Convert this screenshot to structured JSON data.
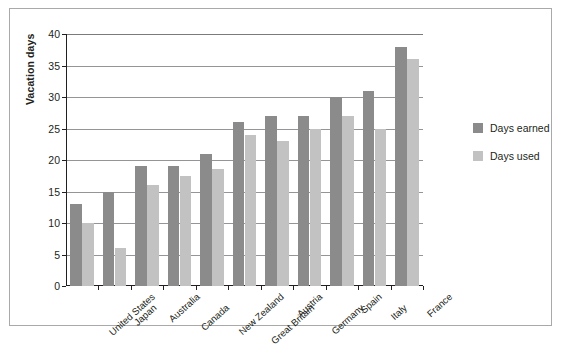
{
  "chart_data": {
    "type": "bar",
    "title": "",
    "xlabel": "",
    "ylabel": "Vacation days",
    "ylim": [
      0,
      40
    ],
    "yticks": [
      0,
      5,
      10,
      15,
      20,
      25,
      30,
      35,
      40
    ],
    "grid": true,
    "legend_position": "right",
    "categories": [
      "United States",
      "Japan",
      "Australia",
      "Canada",
      "New Zealand",
      "Great Britain",
      "Austria",
      "Germany",
      "Spain",
      "Italy",
      "France"
    ],
    "series": [
      {
        "name": "Days earned",
        "color": "#8b8b8b",
        "values": [
          13,
          15,
          19,
          19,
          21,
          26,
          27,
          27,
          30,
          31,
          38
        ]
      },
      {
        "name": "Days used",
        "color": "#c2c2c2",
        "values": [
          10,
          6,
          16,
          17.5,
          18.5,
          24,
          23,
          25,
          27,
          25,
          36
        ]
      }
    ]
  },
  "colors": {
    "earned": "#8b8b8b",
    "used": "#c2c2c2",
    "axis": "#231f20",
    "grid": "#939598",
    "frame": "#a9a9a9"
  }
}
